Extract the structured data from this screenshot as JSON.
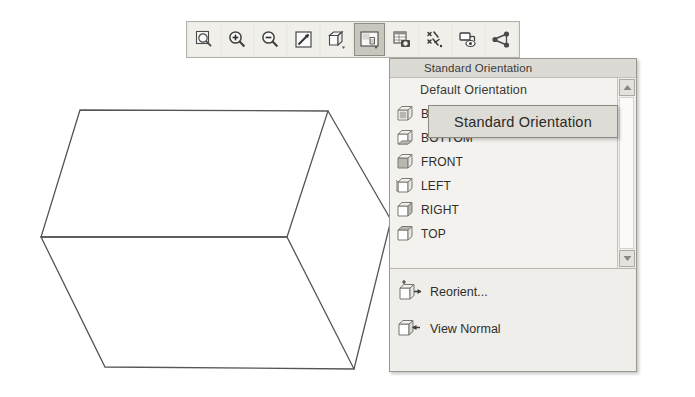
{
  "toolbar": {
    "buttons": [
      {
        "name": "zoom-to-fit-icon",
        "label": "Zoom to Fit",
        "pressed": false,
        "glyph": "magnifier-box"
      },
      {
        "name": "zoom-in-icon",
        "label": "Zoom In",
        "pressed": false,
        "glyph": "magnifier-plus"
      },
      {
        "name": "zoom-out-icon",
        "label": "Zoom Out",
        "pressed": false,
        "glyph": "magnifier-minus"
      },
      {
        "name": "zoom-area-icon",
        "label": "Zoom Area",
        "pressed": false,
        "glyph": "square-diagonal"
      },
      {
        "name": "rotate-view-icon",
        "label": "Rotate View",
        "pressed": false,
        "glyph": "cube"
      },
      {
        "name": "standard-orientation-icon",
        "label": "Standard Orientation",
        "pressed": true,
        "glyph": "orientation"
      },
      {
        "name": "display-style-icon",
        "label": "Display Style",
        "pressed": false,
        "glyph": "panel-camera"
      },
      {
        "name": "hide-show-icon",
        "label": "Hide / Show",
        "pressed": false,
        "glyph": "stars"
      },
      {
        "name": "view-manager-icon",
        "label": "View Manager",
        "pressed": false,
        "glyph": "screen-eye"
      },
      {
        "name": "section-view-icon",
        "label": "Section View",
        "pressed": false,
        "glyph": "node-tree"
      }
    ]
  },
  "dropdown": {
    "header": "Standard Orientation",
    "items": [
      {
        "label": "Default Orientation",
        "icon": "none"
      },
      {
        "label": "BACK",
        "icon": "cube-back-icon"
      },
      {
        "label": "BOTTOM",
        "icon": "cube-bottom-icon"
      },
      {
        "label": "FRONT",
        "icon": "cube-front-icon"
      },
      {
        "label": "LEFT",
        "icon": "cube-left-icon"
      },
      {
        "label": "RIGHT",
        "icon": "cube-right-icon"
      },
      {
        "label": "TOP",
        "icon": "cube-top-icon"
      }
    ],
    "commands": [
      {
        "label": "Reorient...",
        "icon": "reorient-cube-icon"
      },
      {
        "label": "View Normal",
        "icon": "view-normal-cube-icon"
      }
    ],
    "scrollbar": {
      "up_arrow": "scroll-up-arrow-icon",
      "down_arrow": "scroll-down-arrow-icon"
    }
  },
  "tooltip": {
    "text": "Standard Orientation"
  },
  "viewport": {
    "model": "wireframe-box",
    "vertices": {
      "top_left": [
        80,
        110
      ],
      "top_right": [
        328,
        111
      ],
      "mid_left": [
        41,
        237
      ],
      "mid_right": [
        287,
        237
      ],
      "bottom_left": [
        105,
        367
      ],
      "bottom_right": [
        354,
        369
      ],
      "far_right_upper": [
        391,
        220
      ],
      "far_right_lower": [
        391,
        288
      ]
    },
    "line_color": "#555555"
  }
}
